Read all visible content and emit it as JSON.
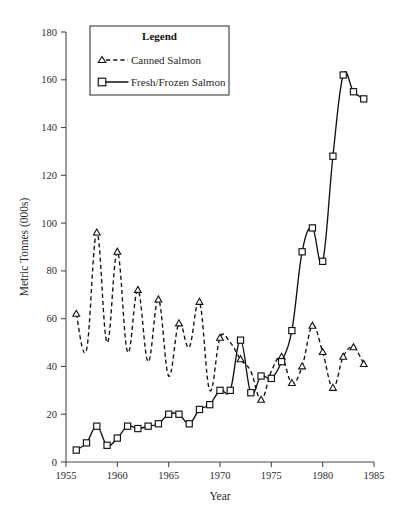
{
  "chart_data": {
    "type": "line",
    "title": "",
    "xlabel": "Year",
    "ylabel": "Metric Tonnes (000s)",
    "xlim": [
      1955,
      1985
    ],
    "ylim": [
      0,
      180
    ],
    "xticks": [
      1955,
      1960,
      1965,
      1970,
      1975,
      1980,
      1985
    ],
    "yticks": [
      0,
      20,
      40,
      60,
      80,
      100,
      120,
      140,
      160,
      180
    ],
    "xticklabels": [
      "1955",
      "1960",
      "1965",
      "1970",
      "1975",
      "1980",
      "1985"
    ],
    "yticklabels": [
      "0",
      "20",
      "40",
      "60",
      "80",
      "100",
      "120",
      "140",
      "160",
      "180"
    ],
    "grid": false,
    "legend": {
      "title": "Legend",
      "position": "top-center",
      "entries": [
        {
          "name": "Canned Salmon",
          "marker": "triangle",
          "linestyle": "dashed"
        },
        {
          "name": "Fresh/Frozen Salmon",
          "marker": "square",
          "linestyle": "solid"
        }
      ]
    },
    "series": [
      {
        "name": "Canned Salmon",
        "marker": "triangle",
        "linestyle": "dashed",
        "x": [
          1956,
          1957,
          1958,
          1959,
          1960,
          1961,
          1962,
          1963,
          1964,
          1965,
          1966,
          1967,
          1968,
          1969,
          1970,
          1971,
          1972,
          1973,
          1974,
          1975,
          1976,
          1977,
          1978,
          1979,
          1980,
          1981,
          1982,
          1983,
          1984
        ],
        "values": [
          62,
          47,
          96,
          50,
          88,
          46,
          72,
          42,
          68,
          36,
          58,
          48,
          67,
          30,
          52,
          50,
          43,
          38,
          26,
          38,
          44,
          33,
          40,
          57,
          46,
          31,
          44,
          48,
          41
        ]
      },
      {
        "name": "Fresh/Frozen Salmon",
        "marker": "square",
        "linestyle": "solid",
        "x": [
          1956,
          1957,
          1958,
          1959,
          1960,
          1961,
          1962,
          1963,
          1964,
          1965,
          1966,
          1967,
          1968,
          1969,
          1970,
          1971,
          1972,
          1973,
          1974,
          1975,
          1976,
          1977,
          1978,
          1979,
          1980,
          1981,
          1982,
          1983,
          1984
        ],
        "values": [
          5,
          8,
          15,
          7,
          10,
          15,
          14,
          15,
          16,
          20,
          20,
          16,
          22,
          24,
          30,
          30,
          51,
          29,
          36,
          35,
          42,
          55,
          88,
          98,
          84,
          128,
          162,
          155,
          152
        ]
      }
    ]
  },
  "axes": {
    "y_title": "Metric Tonnes (000s)",
    "x_title": "Year"
  }
}
